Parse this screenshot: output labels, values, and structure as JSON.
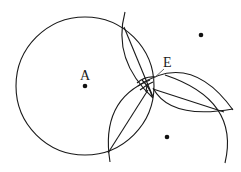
{
  "diagram": {
    "labels": {
      "A": "A",
      "E": "E"
    },
    "points": {
      "A": {
        "x": 85,
        "y": 86
      },
      "top_right": {
        "x": 201,
        "y": 35
      },
      "bottom_right": {
        "x": 167,
        "y": 137
      }
    },
    "colors": {
      "stroke": "#1a1a1a",
      "background": "#ffffff"
    }
  }
}
